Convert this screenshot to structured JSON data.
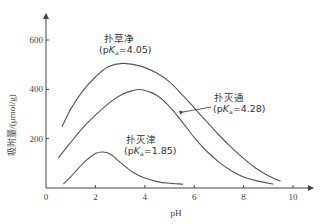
{
  "chart_data": {
    "type": "line",
    "title": "",
    "xlabel": "pH",
    "ylabel": "吸附量/(μmol/g)",
    "xlim": [
      0,
      10.8
    ],
    "ylim": [
      0,
      680
    ],
    "xticks": [
      0,
      2,
      4,
      6,
      8,
      10
    ],
    "yticks": [
      200,
      400,
      600
    ],
    "xtick_labels": [
      "0",
      "2",
      "4",
      "6",
      "8",
      "10"
    ],
    "ytick_labels": [
      "200",
      "400",
      "600"
    ],
    "grid": false,
    "legend": "inline annotations",
    "series": [
      {
        "name": "扑草净",
        "annotation_line1": "扑草净",
        "annotation_line2": "(pKa=4.05)",
        "pKa": 4.05,
        "x": [
          0.65,
          1.0,
          1.5,
          2.0,
          2.5,
          3.1,
          3.8,
          4.5,
          5.0,
          5.5,
          6.0,
          6.5,
          7.0,
          7.5,
          8.0,
          8.5,
          9.0,
          9.5
        ],
        "y": [
          248,
          320,
          395,
          450,
          490,
          505,
          495,
          465,
          430,
          380,
          325,
          270,
          215,
          165,
          120,
          80,
          50,
          28
        ]
      },
      {
        "name": "扑灭通",
        "annotation_line1": "扑灭通",
        "annotation_line2": "(pKa=4.28)",
        "pKa": 4.28,
        "x": [
          0.5,
          1.0,
          1.5,
          2.0,
          2.5,
          3.0,
          3.5,
          3.9,
          4.5,
          5.0,
          5.5,
          6.0,
          6.5,
          7.0,
          7.5,
          8.0,
          8.5,
          9.2
        ],
        "y": [
          122,
          185,
          245,
          295,
          340,
          375,
          395,
          398,
          375,
          330,
          270,
          205,
          150,
          105,
          70,
          45,
          30,
          16
        ]
      },
      {
        "name": "扑灭津",
        "annotation_line1": "扑灭津",
        "annotation_line2": "(pKa=1.85)",
        "pKa": 1.85,
        "x": [
          0.7,
          1.0,
          1.5,
          2.0,
          2.3,
          2.6,
          3.0,
          3.5,
          4.0,
          4.5,
          5.0,
          5.55
        ],
        "y": [
          16,
          45,
          100,
          140,
          146,
          138,
          105,
          65,
          40,
          26,
          19,
          16
        ]
      }
    ]
  },
  "annotations": {
    "s1_name": "扑草净",
    "s1_pka_prefix": "(p",
    "s1_pka_K": "K",
    "s1_pka_sub": "a",
    "s1_pka_value": "=4.05)",
    "s2_name": "扑灭通",
    "s2_pka_prefix": "(p",
    "s2_pka_K": "K",
    "s2_pka_sub": "a",
    "s2_pka_value": "=4.28)",
    "s3_name": "扑灭津",
    "s3_pka_prefix": "(p",
    "s3_pka_K": "K",
    "s3_pka_sub": "a",
    "s3_pka_value": "=1.85)"
  },
  "colors": {
    "line": "#555555",
    "axis": "#444444",
    "text": "#333333"
  }
}
